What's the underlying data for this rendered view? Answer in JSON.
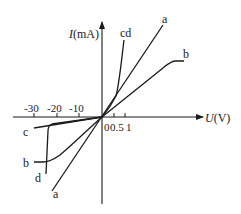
{
  "diagram": {
    "type": "I-U characteristic curves",
    "y_axis": {
      "label_var": "I",
      "label_unit": "(mA)"
    },
    "x_axis": {
      "label_var": "U",
      "label_unit": "(V)"
    },
    "negative_ticks": [
      "-30",
      "-20",
      "-10"
    ],
    "positive_ticks": [
      "0.5",
      "1"
    ],
    "origin_label": "0",
    "curves": {
      "a": "a",
      "b": "b",
      "cd": "cd",
      "c": "c",
      "d": "d"
    },
    "labels": {
      "a_top": "a",
      "a_bottom": "a",
      "b_right": "b",
      "b_left": "b",
      "cd_top": "cd",
      "c_left": "c",
      "d_bottom": "d"
    }
  }
}
